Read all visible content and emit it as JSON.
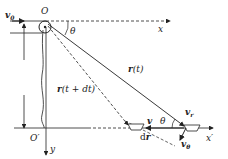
{
  "diagram": {
    "type": "physics-kinematics",
    "labels": {
      "origin": "O",
      "origin_prime": "O′",
      "x_axis": "x",
      "x_prime_axis": "x′",
      "y_axis": "y",
      "height": "h",
      "v0": "v",
      "v0_sub": "0",
      "theta_top": "θ",
      "theta_bottom": "θ",
      "r_t": "r",
      "r_t_arg": "(t)",
      "r_t_dt": "r",
      "r_t_dt_arg": "(t + dt)",
      "v": "v",
      "dr_d": "d",
      "dr_r": "r",
      "vr": "v",
      "vr_sub": "r",
      "vtheta": "v",
      "vtheta_sub": "θ"
    }
  }
}
